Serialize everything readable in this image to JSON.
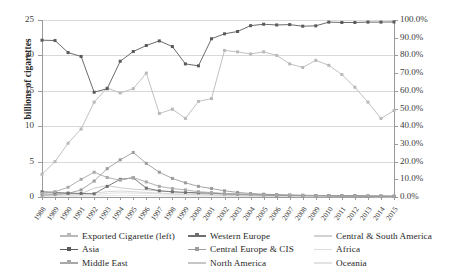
{
  "chart_data": {
    "type": "line",
    "title": "",
    "xlabel": "",
    "ylabel": "billions of cigarettes",
    "y2label": "",
    "ylim": [
      0,
      25
    ],
    "y2lim": [
      0,
      1
    ],
    "grid": true,
    "legend_position": "bottom",
    "x": [
      "1988",
      "1989",
      "1990",
      "1991",
      "1992",
      "1993",
      "1994",
      "1995",
      "1996",
      "1997",
      "1998",
      "1999",
      "2000",
      "2001",
      "2002",
      "2003",
      "2004",
      "2005",
      "2006",
      "2007",
      "2008",
      "2009",
      "2010",
      "2011",
      "2012",
      "2013",
      "2014",
      "2015"
    ],
    "left_axis_ticks": [
      "0",
      "5",
      "10",
      "15",
      "20",
      "25"
    ],
    "right_axis_ticks": [
      "0.0%",
      "10.0%",
      "20.0%",
      "30.0%",
      "40.0%",
      "50.0%",
      "60.0%",
      "70.0%",
      "80.0%",
      "90.0%",
      "100.0%"
    ],
    "series": [
      {
        "name": "Exported Cigarette (left)",
        "axis": "left",
        "color": "#b9b9b9",
        "marker": "square",
        "values": [
          3.2,
          5.0,
          7.6,
          9.6,
          13.4,
          15.4,
          14.7,
          15.3,
          17.5,
          11.8,
          12.4,
          11.1,
          13.5,
          13.9,
          20.7,
          20.5,
          20.2,
          20.5,
          20.0,
          18.8,
          18.3,
          19.3,
          18.6,
          17.3,
          15.5,
          13.4,
          11.1,
          12.2
        ]
      },
      {
        "name": "Asia",
        "axis": "right",
        "color": "#5a5a5a",
        "marker": "square",
        "values": [
          0.886,
          0.884,
          0.816,
          0.794,
          0.592,
          0.612,
          0.767,
          0.822,
          0.856,
          0.882,
          0.85,
          0.752,
          0.741,
          0.894,
          0.922,
          0.935,
          0.968,
          0.976,
          0.972,
          0.974,
          0.965,
          0.967,
          0.988,
          0.986,
          0.986,
          0.988,
          0.988,
          0.989
        ]
      },
      {
        "name": "Middle East",
        "axis": "right",
        "color": "#a8a8a8",
        "marker": "square",
        "values": [
          0.02,
          0.03,
          0.055,
          0.1,
          0.14,
          0.11,
          0.095,
          0.11,
          0.085,
          0.06,
          0.048,
          0.04,
          0.03,
          0.025,
          0.02,
          0.016,
          0.014,
          0.012,
          0.01,
          0.01,
          0.009,
          0.008,
          0.007,
          0.006,
          0.005,
          0.005,
          0.004,
          0.004
        ]
      },
      {
        "name": "Western Europe",
        "axis": "right",
        "color": "#6f6f6f",
        "marker": "square",
        "values": [
          0.03,
          0.026,
          0.022,
          0.02,
          0.018,
          0.06,
          0.1,
          0.108,
          0.05,
          0.035,
          0.03,
          0.026,
          0.024,
          0.022,
          0.018,
          0.016,
          0.014,
          0.012,
          0.01,
          0.009,
          0.008,
          0.008,
          0.007,
          0.006,
          0.006,
          0.005,
          0.005,
          0.004
        ]
      },
      {
        "name": "Central Europe & CIS",
        "axis": "right",
        "color": "#9c9c9c",
        "marker": "square",
        "values": [
          0.01,
          0.014,
          0.02,
          0.04,
          0.09,
          0.16,
          0.21,
          0.252,
          0.19,
          0.14,
          0.105,
          0.08,
          0.06,
          0.048,
          0.035,
          0.026,
          0.02,
          0.016,
          0.013,
          0.011,
          0.01,
          0.009,
          0.008,
          0.007,
          0.006,
          0.005,
          0.005,
          0.004
        ]
      },
      {
        "name": "North America",
        "axis": "right",
        "color": "#c6c6c6",
        "marker": "none",
        "values": [
          0.022,
          0.02,
          0.02,
          0.018,
          0.05,
          0.064,
          0.052,
          0.044,
          0.04,
          0.034,
          0.028,
          0.024,
          0.02,
          0.018,
          0.015,
          0.013,
          0.011,
          0.01,
          0.009,
          0.008,
          0.007,
          0.006,
          0.006,
          0.005,
          0.005,
          0.004,
          0.004,
          0.003
        ]
      },
      {
        "name": "Central & South America",
        "axis": "right",
        "color": "#d2d2d2",
        "marker": "none",
        "values": [
          0.012,
          0.012,
          0.012,
          0.014,
          0.022,
          0.03,
          0.034,
          0.03,
          0.026,
          0.022,
          0.018,
          0.016,
          0.014,
          0.012,
          0.01,
          0.009,
          0.008,
          0.007,
          0.006,
          0.006,
          0.005,
          0.005,
          0.004,
          0.004,
          0.004,
          0.003,
          0.003,
          0.003
        ]
      },
      {
        "name": "Africa",
        "axis": "right",
        "color": "#dcdcdc",
        "marker": "none",
        "values": [
          0.008,
          0.008,
          0.01,
          0.01,
          0.014,
          0.02,
          0.024,
          0.022,
          0.02,
          0.018,
          0.015,
          0.013,
          0.011,
          0.01,
          0.008,
          0.007,
          0.007,
          0.006,
          0.005,
          0.005,
          0.004,
          0.004,
          0.004,
          0.003,
          0.003,
          0.003,
          0.002,
          0.002
        ]
      },
      {
        "name": "Oceania",
        "axis": "right",
        "color": "#e2e2e2",
        "marker": "none",
        "values": [
          0.004,
          0.004,
          0.005,
          0.005,
          0.006,
          0.008,
          0.01,
          0.009,
          0.008,
          0.007,
          0.006,
          0.006,
          0.005,
          0.005,
          0.004,
          0.004,
          0.003,
          0.003,
          0.003,
          0.003,
          0.002,
          0.002,
          0.002,
          0.002,
          0.002,
          0.002,
          0.001,
          0.001
        ]
      }
    ]
  },
  "legend": {
    "items": [
      {
        "label": "Exported Cigarette (left)",
        "color": "#b9b9b9",
        "marker": "square"
      },
      {
        "label": "Asia",
        "color": "#5a5a5a",
        "marker": "square"
      },
      {
        "label": "Middle East",
        "color": "#a8a8a8",
        "marker": "square"
      },
      {
        "label": "Western Europe",
        "color": "#6f6f6f",
        "marker": "square"
      },
      {
        "label": "Central Europe & CIS",
        "color": "#9c9c9c",
        "marker": "square"
      },
      {
        "label": "North America",
        "color": "#c6c6c6",
        "marker": "none"
      },
      {
        "label": "Central & South America",
        "color": "#d2d2d2",
        "marker": "none"
      },
      {
        "label": "Africa",
        "color": "#dcdcdc",
        "marker": "none"
      },
      {
        "label": "Oceania",
        "color": "#e2e2e2",
        "marker": "none"
      }
    ]
  }
}
